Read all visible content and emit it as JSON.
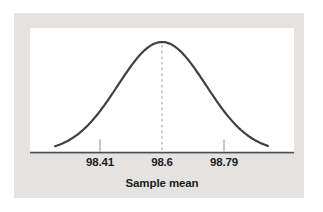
{
  "colors": {
    "figure_background": "#e4e3e1",
    "plot_background": "#ffffff",
    "curve": "#414141",
    "axis": "#4d4d4d",
    "dashed_mean_line": "#a8a8a8",
    "tick": "#a2a2a2",
    "label_text": "#1c1c1c"
  },
  "chart_data": {
    "type": "line",
    "subtype": "normal-distribution-curve",
    "title": "",
    "xlabel": "Sample mean",
    "x_tick_labels": [
      "98.41",
      "98.6",
      "98.79"
    ],
    "x_tick_values": [
      98.41,
      98.6,
      98.79
    ],
    "mean": 98.6,
    "sigma_estimate": 0.135,
    "mean_line_style": "dashed",
    "grid": false,
    "legend": false,
    "ylabel": ""
  }
}
